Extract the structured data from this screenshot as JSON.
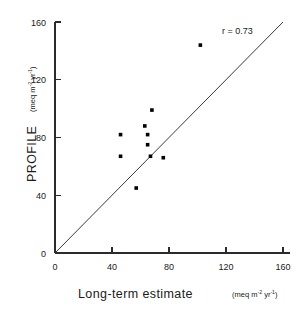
{
  "chart_data": {
    "type": "scatter",
    "title": "",
    "xlabel": "Long-term estimate",
    "xunits": "(meq m-2 yr-1)",
    "ylabel": "PROFILE",
    "yunits": "(meq m-2 yr-1)",
    "xlim": [
      0,
      160
    ],
    "ylim": [
      0,
      160
    ],
    "xticks": [
      0,
      40,
      80,
      120,
      160
    ],
    "yticks": [
      0,
      40,
      80,
      120,
      160
    ],
    "xtick_labels": [
      "0",
      "40",
      "80",
      "120",
      "160"
    ],
    "ytick_labels": [
      "0",
      "40",
      "80",
      "120",
      "160"
    ],
    "grid": false,
    "legend": false,
    "series": [
      {
        "name": "sites",
        "marker": "square",
        "color": "#000000",
        "points": [
          {
            "x": 46,
            "y": 82
          },
          {
            "x": 46,
            "y": 67
          },
          {
            "x": 57,
            "y": 45
          },
          {
            "x": 63,
            "y": 88
          },
          {
            "x": 65,
            "y": 82
          },
          {
            "x": 65,
            "y": 75
          },
          {
            "x": 67,
            "y": 67
          },
          {
            "x": 68,
            "y": 99
          },
          {
            "x": 76,
            "y": 66
          },
          {
            "x": 102,
            "y": 144
          }
        ]
      }
    ],
    "reference_line": {
      "name": "one-to-one line",
      "from": [
        0,
        0
      ],
      "to": [
        160,
        160
      ],
      "slope": 1,
      "intercept": 0
    },
    "annotations": [
      {
        "name": "correlation",
        "text": "r = 0.73",
        "x": 128,
        "y": 152
      }
    ]
  },
  "axis": {
    "x_title": "Long-term  estimate",
    "x_units_base": "(meq m",
    "x_units_sup1": "-2",
    "x_units_mid": " yr",
    "x_units_sup2": "-1",
    "x_units_close": ")",
    "y_title": "PROFILE",
    "y_units_base": "(meq m",
    "y_units_sup1": "-2",
    "y_units_mid": " yr",
    "y_units_sup2": "-1",
    "y_units_close": ")"
  },
  "ticks": {
    "x": [
      "0",
      "40",
      "80",
      "120",
      "160"
    ],
    "y": [
      "0",
      "40",
      "80",
      "120",
      "160"
    ]
  },
  "annotation": {
    "correlation_label": "r = 0.73"
  },
  "colors": {
    "background": "#ffffff",
    "axis": "#2b2b2b",
    "marker": "#000000",
    "reference_line": "#3a3a3a",
    "text": "#1a1a1a"
  }
}
